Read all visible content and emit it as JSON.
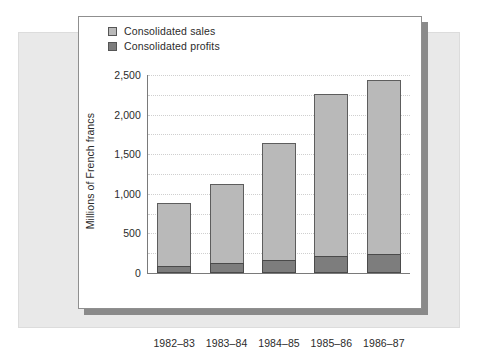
{
  "chart_data": {
    "type": "bar",
    "subtype": "stacked-bar",
    "title": "",
    "xlabel": "",
    "ylabel": "Millions of French francs",
    "categories": [
      "1982–83",
      "1983–84",
      "1984–85",
      "1985–86",
      "1986–87"
    ],
    "series": [
      {
        "name": "Consolidated sales",
        "color": "#b9b9b9",
        "values": [
          880,
          1120,
          1640,
          2260,
          2440
        ]
      },
      {
        "name": "Consolidated profits",
        "color": "#7d7d7d",
        "values": [
          90,
          130,
          165,
          215,
          245
        ]
      }
    ],
    "ylim": [
      0,
      2500
    ],
    "ytick_labels": [
      "0",
      "500",
      "1,000",
      "1,500",
      "2,000",
      "2,500"
    ],
    "ytick_values": [
      0,
      500,
      1000,
      1500,
      2000,
      2500
    ],
    "gridline_values": [
      250,
      500,
      750,
      1000,
      1250,
      1500,
      1750,
      2000,
      2250,
      2500
    ],
    "grid": true,
    "legend_position": "top-left",
    "note": "Stacked bars: the dark profits segment is drawn at the base of each light sales bar."
  },
  "legend": {
    "items": [
      {
        "label": "Consolidated sales",
        "color": "#b9b9b9"
      },
      {
        "label": "Consolidated profits",
        "color": "#7d7d7d"
      }
    ]
  },
  "axis": {
    "y_title": "Millions of French francs"
  },
  "colors": {
    "sales": "#b9b9b9",
    "profits": "#7d7d7d",
    "backdrop": "#e9e9e9",
    "card": "#ffffff",
    "shadow": "#8a8a8a",
    "axis": "#7a7a7a",
    "grid": "#cfcfcf"
  }
}
